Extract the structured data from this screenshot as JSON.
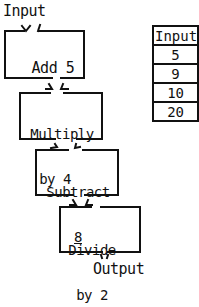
{
  "flowchart": {
    "input_label": "Input",
    "output_label": "Output",
    "steps": [
      {
        "line1": "Add 5",
        "line2": ""
      },
      {
        "line1": "Multiply",
        "line2": "by 4"
      },
      {
        "line1": "Subtract",
        "line2": "8"
      },
      {
        "line1": "Divide",
        "line2": "by 2"
      }
    ]
  },
  "table": {
    "header": "Input",
    "rows": [
      "5",
      "9",
      "10",
      "20"
    ]
  }
}
